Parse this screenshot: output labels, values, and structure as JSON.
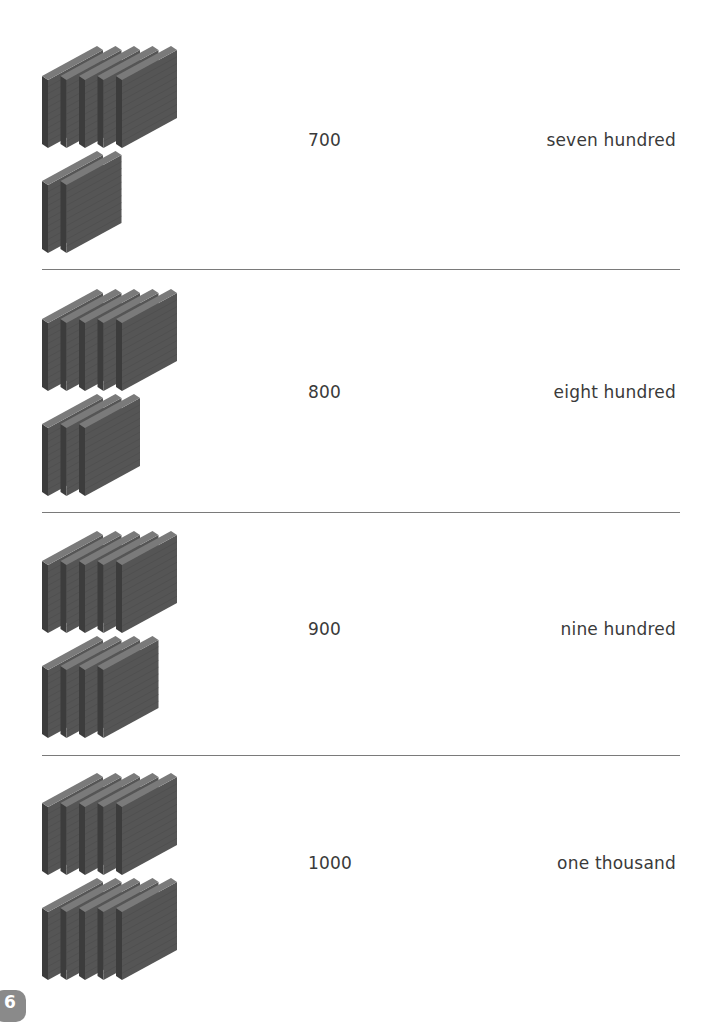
{
  "page": {
    "number": "6"
  },
  "colors": {
    "flat_face": "#555555",
    "flat_top": "#7a7a7a",
    "flat_side": "#3c3c3c",
    "text": "#3a3a3a",
    "divider": "#7a7a7a",
    "badge": "#8a8a8a"
  },
  "rows": [
    {
      "hundreds_flats": 7,
      "top_group_count": 5,
      "bottom_group_count": 2,
      "numeral": "700",
      "word": "seven hundred"
    },
    {
      "hundreds_flats": 8,
      "top_group_count": 5,
      "bottom_group_count": 3,
      "numeral": "800",
      "word": "eight hundred"
    },
    {
      "hundreds_flats": 9,
      "top_group_count": 5,
      "bottom_group_count": 4,
      "numeral": "900",
      "word": "nine hundred"
    },
    {
      "hundreds_flats": 10,
      "top_group_count": 5,
      "bottom_group_count": 5,
      "numeral": "1000",
      "word": "one thousand"
    }
  ]
}
